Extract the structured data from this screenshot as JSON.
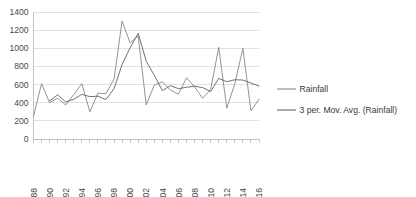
{
  "chart_data": {
    "type": "line",
    "title": "",
    "xlabel": "",
    "ylabel": "",
    "ylim": [
      0,
      1400
    ],
    "ytick_step": 200,
    "yticks": [
      0,
      200,
      400,
      600,
      800,
      1000,
      1200,
      1400
    ],
    "xlim": [
      1988,
      2016
    ],
    "xticks_every": 1,
    "xtick_labels_every": 2,
    "grid": "horizontal",
    "legend_position": "right",
    "x": [
      1988,
      1989,
      1990,
      1991,
      1992,
      1993,
      1994,
      1995,
      1996,
      1997,
      1998,
      1999,
      2000,
      2001,
      2002,
      2003,
      2004,
      2005,
      2006,
      2007,
      2008,
      2009,
      2010,
      2011,
      2012,
      2013,
      2014,
      2015,
      2016
    ],
    "xtick_labels": [
      "1988",
      "1990",
      "1992",
      "1994",
      "1996",
      "1998",
      "2000",
      "2002",
      "2004",
      "2006",
      "2008",
      "2010",
      "2012",
      "2014",
      "2016"
    ],
    "series": [
      {
        "name": "Rainfall",
        "color": "#808080",
        "values": [
          250,
          610,
          400,
          450,
          375,
          490,
          610,
          300,
          505,
          500,
          660,
          1300,
          1060,
          1135,
          375,
          595,
          630,
          540,
          495,
          675,
          575,
          450,
          545,
          1010,
          340,
          610,
          1000,
          310,
          440
        ]
      },
      {
        "name": "3 per. Mov. Avg. (Rainfall)",
        "color": "#595959",
        "values": [
          null,
          null,
          420,
          487,
          408,
          438,
          492,
          467,
          472,
          435,
          555,
          820,
          1007,
          1165,
          857,
          702,
          533,
          588,
          555,
          570,
          582,
          567,
          523,
          668,
          632,
          653,
          650,
          617,
          583
        ]
      }
    ],
    "legend": [
      {
        "label": "Rainfall",
        "color": "#808080"
      },
      {
        "label": "3 per. Mov. Avg. (Rainfall)",
        "color": "#595959"
      }
    ]
  }
}
